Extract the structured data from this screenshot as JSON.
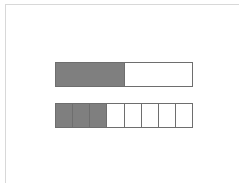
{
  "diagram": {
    "type": "fraction-bars",
    "shade_color": "#7f7f7f",
    "empty_color": "#ffffff",
    "border_color": "#6e6e6e",
    "bars": [
      {
        "name": "top-bar",
        "parts": 2,
        "shaded": 1,
        "fraction": "1/2"
      },
      {
        "name": "bottom-bar",
        "parts": 8,
        "shaded": 3,
        "fraction": "3/8"
      }
    ]
  }
}
